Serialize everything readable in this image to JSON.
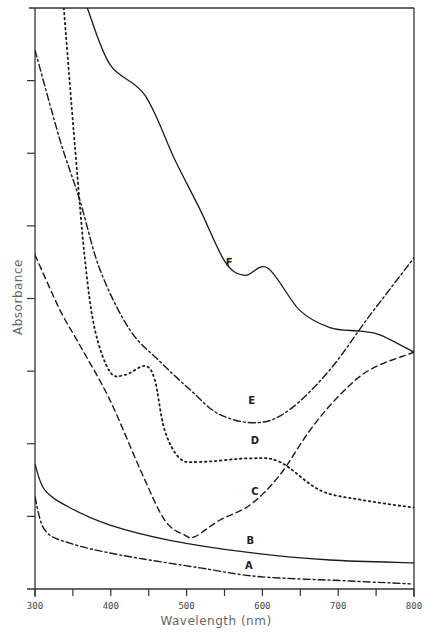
{
  "chart_data": {
    "type": "line",
    "title": "",
    "xlabel": "Wavelength  (nm)",
    "ylabel": "Absorbance",
    "xlim": [
      300,
      800
    ],
    "ylim": [
      0,
      8
    ],
    "x_ticks": [
      300,
      350,
      400,
      450,
      500,
      550,
      600,
      650,
      700,
      750,
      800
    ],
    "x_tick_labels": [
      "300",
      "400",
      "500",
      "600",
      "700",
      "800"
    ],
    "x_tick_label_values": [
      300,
      400,
      500,
      600,
      700,
      800
    ],
    "y_ticks": [
      1,
      2,
      3,
      4,
      5,
      6,
      7
    ],
    "y_tick_labels": [],
    "y_units": "arbitrary (unlabeled ticks)",
    "grid": false,
    "legend": "inline curve labels",
    "series": [
      {
        "name": "A",
        "style": "dash-dot",
        "label_at": [
          582,
          0.33
        ],
        "x": [
          300,
          313,
          346,
          412,
          518,
          597,
          716,
          795
        ],
        "y": [
          1.27,
          0.81,
          0.63,
          0.47,
          0.29,
          0.17,
          0.11,
          0.07
        ]
      },
      {
        "name": "B",
        "style": "solid",
        "label_at": [
          584,
          0.68
        ],
        "x": [
          300,
          313,
          346,
          399,
          478,
          584,
          689,
          800
        ],
        "y": [
          1.72,
          1.36,
          1.12,
          0.88,
          0.67,
          0.5,
          0.4,
          0.36
        ]
      },
      {
        "name": "C",
        "style": "dashed",
        "label_at": [
          590,
          1.35
        ],
        "x": [
          300,
          333,
          359,
          399,
          439,
          471,
          498,
          511,
          544,
          584,
          623,
          663,
          702,
          742,
          800
        ],
        "y": [
          4.6,
          3.84,
          3.36,
          2.6,
          1.64,
          0.95,
          0.74,
          0.72,
          0.95,
          1.16,
          1.57,
          2.19,
          2.67,
          3.02,
          3.26
        ]
      },
      {
        "name": "D",
        "style": "dotted",
        "label_at": [
          590,
          2.05
        ],
        "x": [
          338,
          353,
          366,
          379,
          399,
          419,
          445,
          458,
          471,
          491,
          518,
          584,
          623,
          676,
          729,
          800
        ],
        "y": [
          8.0,
          6.05,
          4.53,
          3.57,
          2.99,
          2.95,
          3.07,
          2.88,
          2.19,
          1.8,
          1.75,
          1.8,
          1.75,
          1.36,
          1.23,
          1.12
        ]
      },
      {
        "name": "E",
        "style": "dash-dot",
        "label_at": [
          586,
          2.6
        ],
        "x": [
          300,
          333,
          359,
          386,
          425,
          465,
          505,
          544,
          594,
          636,
          689,
          742,
          800
        ],
        "y": [
          7.42,
          6.18,
          5.36,
          4.39,
          3.57,
          3.13,
          2.74,
          2.4,
          2.29,
          2.47,
          3.02,
          3.77,
          4.56
        ]
      },
      {
        "name": "F",
        "style": "solid",
        "label_at": [
          556,
          4.5
        ],
        "x": [
          369,
          399,
          445,
          485,
          518,
          551,
          577,
          607,
          649,
          689,
          729,
          755,
          800
        ],
        "y": [
          8.0,
          7.22,
          6.8,
          5.9,
          5.22,
          4.5,
          4.32,
          4.42,
          3.84,
          3.6,
          3.55,
          3.5,
          3.26
        ]
      }
    ]
  }
}
